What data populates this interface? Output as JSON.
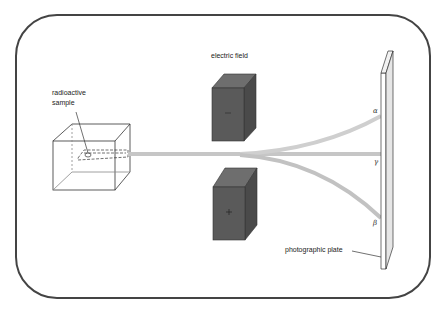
{
  "diagram": {
    "labels": {
      "sample_line1": "radioactive",
      "sample_line2": "sample",
      "field": "electric field",
      "plate": "photographic plate",
      "alpha": "α",
      "gamma": "γ",
      "beta": "β",
      "negative_plate": "−",
      "positive_plate": "+"
    },
    "colors": {
      "border": "#444444",
      "electrode": "#5a5a5a",
      "electrode_top": "#707070",
      "electrode_side": "#4a4a4a",
      "beam": "#c8c8c8",
      "outline": "#333333"
    }
  }
}
